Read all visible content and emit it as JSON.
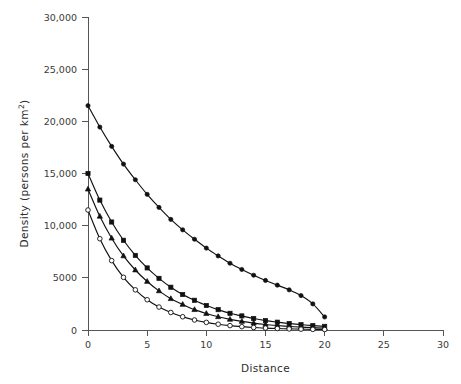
{
  "chart_data": {
    "type": "line",
    "title": "",
    "subtitle": "",
    "xlabel": "Distance",
    "ylabel": "Density (persons per km²)",
    "ylabel_main": "Density (persons per km",
    "ylabel_sup": "2",
    "ylabel_tail": ")",
    "xlim": [
      0,
      30
    ],
    "ylim": [
      0,
      30000
    ],
    "grid": false,
    "legend": "none",
    "x_ticks": [
      0,
      5,
      10,
      15,
      20,
      25,
      30
    ],
    "x_tick_labels": [
      "0",
      "5",
      "10",
      "15",
      "20",
      "25",
      "30"
    ],
    "y_ticks": [
      0,
      5000,
      10000,
      15000,
      20000,
      25000,
      30000
    ],
    "y_tick_labels": [
      "0",
      "5000",
      "10,000",
      "15,000",
      "20,000",
      "25,000",
      "30,000"
    ],
    "x": [
      0,
      1,
      2,
      3,
      4,
      5,
      6,
      7,
      8,
      9,
      10,
      11,
      12,
      13,
      14,
      15,
      16,
      17,
      18,
      19,
      20
    ],
    "series": [
      {
        "name": "curve-1",
        "marker": "filled-circle",
        "values": [
          21500,
          19450,
          17600,
          15900,
          14400,
          13000,
          11750,
          10600,
          9600,
          8700,
          7850,
          7100,
          6400,
          5800,
          5250,
          4750,
          4300,
          3850,
          3300,
          2500,
          1250
        ]
      },
      {
        "name": "curve-2",
        "marker": "filled-square",
        "values": [
          15000,
          12450,
          10350,
          8600,
          7150,
          5950,
          4950,
          4100,
          3400,
          2850,
          2350,
          1950,
          1600,
          1350,
          1100,
          900,
          750,
          620,
          510,
          420,
          350
        ]
      },
      {
        "name": "curve-3",
        "marker": "triangle",
        "values": [
          13500,
          10900,
          8800,
          7100,
          5750,
          4650,
          3750,
          3000,
          2450,
          1950,
          1580,
          1270,
          1020,
          820,
          660,
          530,
          430,
          345,
          275,
          225,
          180
        ]
      },
      {
        "name": "curve-4",
        "marker": "open-circle",
        "values": [
          11500,
          8750,
          6650,
          5050,
          3850,
          2900,
          2200,
          1680,
          1270,
          960,
          730,
          555,
          420,
          320,
          240,
          185,
          140,
          105,
          80,
          60,
          45
        ]
      }
    ]
  },
  "colors": {
    "axis": "#555555",
    "curve": "#111111",
    "marker_fill": "#111111",
    "marker_open": "#ffffff",
    "background": "#ffffff"
  }
}
